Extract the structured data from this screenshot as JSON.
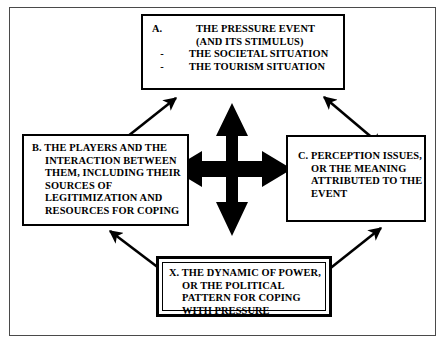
{
  "diagram": {
    "frame": {
      "border_color": "#4a4a4a"
    },
    "nodes": {
      "a": {
        "marker": "A.",
        "lines": [
          "THE PRESSURE EVENT",
          "(AND ITS STIMULUS)"
        ],
        "bullets": [
          {
            "dash": "-",
            "text": "THE SOCIETAL SITUATION"
          },
          {
            "dash": "-",
            "text": "THE TOURISM SITUATION"
          }
        ]
      },
      "b": {
        "lines": [
          "B. THE PLAYERS AND THE",
          "INTERACTION BETWEEN",
          "THEM, INCLUDING THEIR",
          "SOURCES OF",
          "LEGITIMIZATION AND",
          "RESOURCES FOR COPING"
        ]
      },
      "c": {
        "lines": [
          "C. PERCEPTION ISSUES,",
          "OR THE MEANING",
          "ATTRIBUTED TO THE",
          "EVENT"
        ]
      },
      "x": {
        "lines": [
          "X. THE DYNAMIC OF POWER,",
          "OR THE POLITICAL",
          "PATTERN FOR COPING",
          "WITH PRESSURE"
        ]
      }
    },
    "connectors": {
      "center": "four-way-double-arrow",
      "top_left": "double-headed-diagonal-arrow",
      "top_right": "double-headed-diagonal-arrow",
      "bottom_left": "double-headed-diagonal-arrow",
      "bottom_right": "double-headed-diagonal-arrow",
      "color": "#000000"
    }
  }
}
